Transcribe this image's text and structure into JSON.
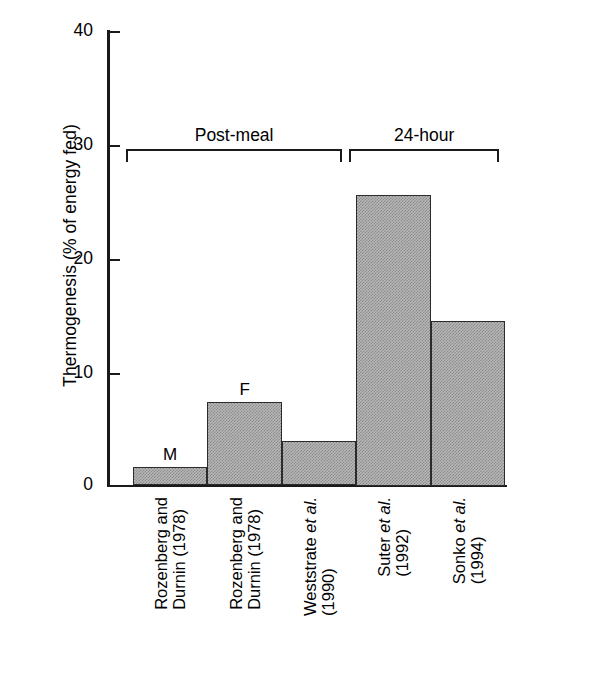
{
  "chart_data": {
    "type": "bar",
    "title": "",
    "xlabel": "",
    "ylabel": "Thermogenesis (% of energy fed)",
    "ylim": [
      0,
      40
    ],
    "yticks": [
      0,
      10,
      20,
      30,
      40
    ],
    "ytick_labels": [
      "0",
      "10",
      "20",
      "30",
      "40"
    ],
    "grid": false,
    "legend": null,
    "categories": [
      "Rozenberg and Durnin (1978)",
      "Rozenberg and Durnin (1978)",
      "Weststrate et al. (1990)",
      "Suter et al. (1992)",
      "Sonko et al. (1994)"
    ],
    "values": [
      1.6,
      7.3,
      3.9,
      25.5,
      14.5
    ],
    "point_annotations": [
      "M",
      "F",
      "",
      "",
      ""
    ],
    "groups": [
      {
        "label": "Post-meal",
        "categories": [
          0,
          1,
          2
        ]
      },
      {
        "label": "24-hour",
        "categories": [
          3,
          4
        ]
      }
    ],
    "bar_fill_color": "#b8b8b8",
    "bar_edge_color": "#2b2b2b",
    "axis_color": "#1a1a1a"
  },
  "axis": {
    "y_title": "Thermogenesis (% of energy fed)",
    "ticks": [
      {
        "label": "40",
        "value": 40
      },
      {
        "label": "30",
        "value": 30
      },
      {
        "label": "20",
        "value": 20
      },
      {
        "label": "10",
        "value": 10
      },
      {
        "label": "0",
        "value": 0
      }
    ]
  },
  "brackets": [
    {
      "label": "Post-meal"
    },
    {
      "label": "24-hour"
    }
  ],
  "bars": [
    {
      "value": 1.6,
      "annotation": "M",
      "label_line1": "Rozenberg and",
      "label_line2": "Durnin (1978)",
      "label_italic1": "",
      "label_italic2": ""
    },
    {
      "value": 7.3,
      "annotation": "F",
      "label_line1": "Rozenberg and",
      "label_line2": "Durnin (1978)",
      "label_italic1": "",
      "label_italic2": ""
    },
    {
      "value": 3.9,
      "annotation": "",
      "label_line1": "Weststrate ",
      "label_italic1": "et al.",
      "label_line2": "(1990)",
      "label_italic2": ""
    },
    {
      "value": 25.5,
      "annotation": "",
      "label_line1": "Suter ",
      "label_italic1": "et al.",
      "label_line2": "(1992)",
      "label_italic2": ""
    },
    {
      "value": 14.5,
      "annotation": "",
      "label_line1": "Sonko ",
      "label_italic1": "et al.",
      "label_line2": "(1994)",
      "label_italic2": ""
    }
  ]
}
